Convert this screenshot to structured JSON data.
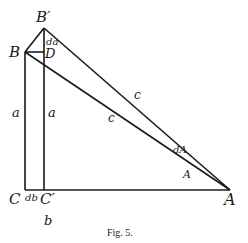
{
  "figure": {
    "caption": "Fig. 5.",
    "labels": {
      "B_prime": "B′",
      "B": "B",
      "D": "D",
      "da": "da",
      "a_left": "a",
      "a_right": "a",
      "c_upper": "c",
      "c_lower": "c",
      "dA": "dA",
      "A_angle": "A",
      "A_vertex": "A",
      "C": "C",
      "db": "db",
      "C_prime": "C′",
      "b": "b"
    },
    "points": {
      "B": [
        25,
        52
      ],
      "B_prime": [
        44,
        28
      ],
      "D": [
        44,
        52
      ],
      "C": [
        25,
        190
      ],
      "C_prime": [
        44,
        190
      ],
      "A": [
        230,
        190
      ]
    },
    "stroke_color": "#1a1a1a",
    "background": "#ffffff"
  }
}
